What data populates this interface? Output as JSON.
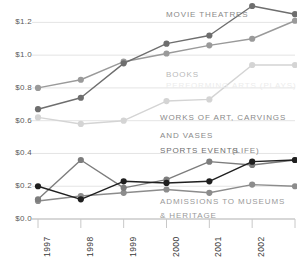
{
  "chart_data": {
    "type": "line",
    "title": "",
    "subtitle": "",
    "xlabel": "",
    "ylabel": "",
    "x": [
      "1997",
      "1998",
      "1999",
      "2000",
      "2001",
      "2002",
      "2003"
    ],
    "categories": [
      "1997",
      "1998",
      "1999",
      "2000",
      "2001",
      "2002",
      "2003"
    ],
    "xlim": [
      "1997",
      "2003"
    ],
    "ylim": [
      0.0,
      1.3
    ],
    "yticks": [
      0.0,
      0.2,
      0.4,
      0.6,
      0.8,
      1.0,
      1.2
    ],
    "ytick_labels": [
      "$0.0",
      "$0.2",
      "$0.4",
      "$0.6",
      "$0.8",
      "$1.0",
      "$1.2"
    ],
    "grid": true,
    "grid_axis": "y",
    "legend": "inline-annotations",
    "legend_position": "inline",
    "y_prefix": "$",
    "series": [
      {
        "name": "MOVIE THEATRES",
        "color": "#6e6e6e",
        "label_color": "#8a8a8a",
        "marker": "circle",
        "values": [
          0.67,
          0.74,
          0.95,
          1.07,
          1.12,
          1.3,
          1.25
        ]
      },
      {
        "name": "BOOKS",
        "color": "#9a9a9a",
        "label_color": "#b4b4b4",
        "marker": "circle",
        "values": [
          0.8,
          0.85,
          0.96,
          1.01,
          1.06,
          1.1,
          1.21
        ]
      },
      {
        "name": "PERFORMING ARTS (PLAYS)",
        "color": "#d4d4d4",
        "label_color": "#e2e2e2",
        "marker": "circle",
        "values": [
          0.62,
          0.58,
          0.6,
          0.72,
          0.73,
          0.94,
          0.94
        ]
      },
      {
        "name": "WORKS OF ART, CARVINGS AND VASES",
        "color": "#7d7d7d",
        "label_color": "#8a8a8a",
        "marker": "circle",
        "values": [
          0.12,
          0.36,
          0.19,
          0.24,
          0.35,
          0.33,
          0.36
        ]
      },
      {
        "name": "SPORTS EVENTS (LIFE)",
        "color": "#1f1f1f",
        "label_color": "#6e6e6e",
        "marker": "circle",
        "values": [
          0.2,
          0.12,
          0.23,
          0.22,
          0.23,
          0.35,
          0.36
        ]
      },
      {
        "name": "ADMISSIONS TO MUSEUMS & HERITAGE",
        "color": "#8c8c8c",
        "label_color": "#9a9a9a",
        "marker": "circle",
        "values": [
          0.11,
          0.14,
          0.16,
          0.18,
          0.16,
          0.21,
          0.2
        ]
      }
    ],
    "annotations": [
      {
        "id": "movie-theatres",
        "text": "MOVIE THEATRES",
        "x": 166,
        "y": 10,
        "color": "#8a8a8a"
      },
      {
        "id": "books",
        "text": "BOOKS",
        "x": 166,
        "y": 70,
        "color": "#b9b9b9"
      },
      {
        "id": "performing-arts",
        "text": "PERFORMING ARTS (PLAYS)",
        "x": 166,
        "y": 81,
        "color": "#ececec"
      },
      {
        "id": "works-of-art-1",
        "text": "WORKS OF ART, CARVINGS",
        "x": 160,
        "y": 113,
        "color": "#8a8a8a"
      },
      {
        "id": "works-of-art-2",
        "text": "AND VASES",
        "x": 160,
        "y": 131,
        "color": "#8a8a8a"
      },
      {
        "id": "sports-events",
        "text": "SPORTS EVENTS",
        "x": 160,
        "y": 146,
        "color": "#6e6e6e"
      },
      {
        "id": "sports-events-life",
        "text": "(LIFE)",
        "x": 232,
        "y": 146,
        "color": "#8a8a8a"
      },
      {
        "id": "museums-1",
        "text": "ADMISSIONS TO MUSEUMS",
        "x": 160,
        "y": 197,
        "color": "#9a9a9a"
      },
      {
        "id": "museums-2",
        "text": "& HERITAGE",
        "x": 160,
        "y": 211,
        "color": "#9a9a9a"
      }
    ]
  },
  "axis_colors": {
    "grid": "#e4e4e4",
    "baseline": "#b0b0b0",
    "tick_mark": "#c8c8c8",
    "ytick_text": "#5a5a5a",
    "xtick_text": "#3a3a3a"
  }
}
